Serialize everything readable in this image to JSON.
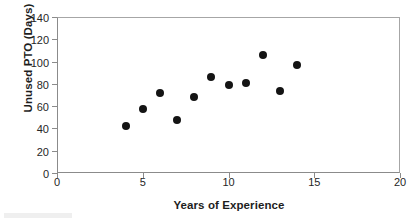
{
  "chart_data": {
    "type": "scatter",
    "title": "",
    "xlabel": "Years of Experience",
    "ylabel": "Unused PTO (Days)",
    "xlim": [
      0,
      20
    ],
    "ylim": [
      0,
      140
    ],
    "xticks": [
      0,
      5,
      10,
      15,
      20
    ],
    "yticks": [
      0,
      20,
      40,
      60,
      80,
      100,
      120,
      140
    ],
    "xtick_labels": [
      "0",
      "5",
      "10",
      "15",
      "20"
    ],
    "ytick_labels": [
      "0",
      "20",
      "40",
      "60",
      "80",
      "100",
      "120",
      "140"
    ],
    "grid": false,
    "legend": false,
    "marker": "filled-circle",
    "marker_color": "#141414",
    "points": [
      {
        "x": 4,
        "y": 42
      },
      {
        "x": 5,
        "y": 57
      },
      {
        "x": 6,
        "y": 72
      },
      {
        "x": 7,
        "y": 48
      },
      {
        "x": 8,
        "y": 68
      },
      {
        "x": 9,
        "y": 86
      },
      {
        "x": 10,
        "y": 79
      },
      {
        "x": 11,
        "y": 81
      },
      {
        "x": 12,
        "y": 106
      },
      {
        "x": 13,
        "y": 74
      },
      {
        "x": 14,
        "y": 97
      }
    ]
  },
  "colors": {
    "axis": "#8b8b8b",
    "frame": "#a6a6a6",
    "text": "#1d1d1d",
    "marker": "#141414",
    "background": "#ffffff"
  }
}
